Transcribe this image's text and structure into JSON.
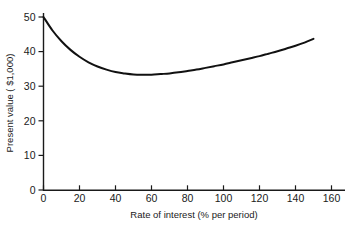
{
  "chart_data": {
    "type": "line",
    "title": "",
    "subtitle": "",
    "xlabel": "Rate of interest (% per period)",
    "ylabel": "Present value ( $1,000)",
    "xlim": [
      0,
      170
    ],
    "ylim": [
      0,
      52
    ],
    "xticks": [
      0,
      20,
      40,
      60,
      80,
      100,
      120,
      140,
      160
    ],
    "yticks": [
      0,
      10,
      20,
      30,
      40,
      50
    ],
    "xticklabels": [
      "0",
      "20",
      "40",
      "60",
      "80",
      "100",
      "120",
      "140",
      "160"
    ],
    "yticklabels": [
      "0",
      "10",
      "20",
      "30",
      "40",
      "50"
    ],
    "grid": false,
    "legend": null,
    "legend_position": "none",
    "series": [
      {
        "name": "Present value",
        "color": "#111111",
        "x": [
          0,
          5,
          10,
          15,
          20,
          25,
          30,
          35,
          40,
          45,
          50,
          55,
          60,
          65,
          70,
          75,
          80,
          85,
          90,
          95,
          100,
          105,
          110,
          115,
          120,
          125,
          130,
          135,
          140,
          145,
          150
        ],
        "y": [
          50.0,
          46.1,
          43.0,
          40.5,
          38.5,
          36.9,
          35.7,
          34.8,
          34.1,
          33.7,
          33.4,
          33.3,
          33.3,
          33.5,
          33.7,
          34.0,
          34.4,
          34.8,
          35.3,
          35.8,
          36.3,
          36.9,
          37.5,
          38.1,
          38.7,
          39.4,
          40.1,
          40.9,
          41.7,
          42.6,
          43.7
        ]
      }
    ],
    "annotations": [],
    "notes": {
      "minimum_value": 33.3,
      "minimum_at_rate": 57,
      "start_value": 50.0,
      "end_value": 43.7,
      "end_rate": 150
    }
  },
  "axes": {
    "x_axis_name": "rate-of-interest-axis",
    "y_axis_name": "present-value-axis"
  }
}
